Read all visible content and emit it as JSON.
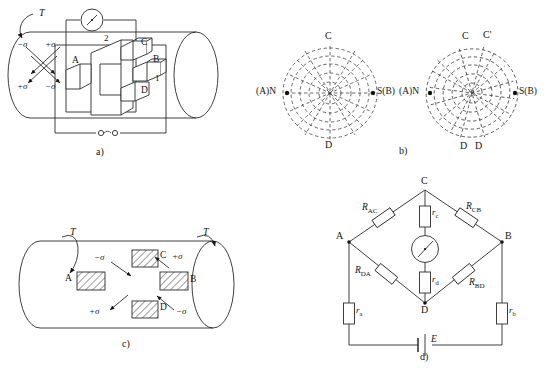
{
  "figure": {
    "panels": [
      {
        "id": "a",
        "caption": "a)"
      },
      {
        "id": "b",
        "caption": "b)"
      },
      {
        "id": "c",
        "caption": "c)"
      },
      {
        "id": "d",
        "caption": "d)"
      }
    ]
  },
  "panel_a": {
    "caption": "a)",
    "torque_label": "T",
    "stress": {
      "top_left": "−σ",
      "top_right": "+σ",
      "bottom_left": "+σ",
      "bottom_right": "−σ"
    },
    "core_labels": {
      "A": "A",
      "B": "B",
      "C": "C",
      "D": "D"
    },
    "winding_labels": {
      "secondary": "2",
      "primary": "1"
    },
    "meter_icon": "galvanometer-icon",
    "terminal_icon": "terminal-pair-icon"
  },
  "panel_b": {
    "caption": "b)",
    "left_diagram": {
      "name": "symmetric-flux-pattern",
      "top": "C",
      "bottom": "D",
      "left": "(A)N",
      "right": "S(B)",
      "left_pole_dot": "•",
      "right_pole_dot": "•"
    },
    "right_diagram": {
      "name": "skewed-flux-pattern",
      "top": "C",
      "top_prime": "C'",
      "bottom_left": "D",
      "bottom_right": "D",
      "left": "(A)N",
      "right": "S(B)",
      "left_pole_dot": "•",
      "right_pole_dot": "•"
    }
  },
  "panel_c": {
    "caption": "c)",
    "torque_left": "T",
    "torque_right": "T",
    "pads": [
      {
        "id": "A",
        "label": "A"
      },
      {
        "id": "C",
        "label": "C"
      },
      {
        "id": "B",
        "label": "B"
      },
      {
        "id": "D",
        "label": "D"
      }
    ],
    "stress": {
      "top_left": "−σ",
      "top_right": "+σ",
      "bottom_left": "+σ",
      "bottom_right": "−σ"
    }
  },
  "panel_d": {
    "caption": "d)",
    "nodes": {
      "top": "C",
      "left": "A",
      "right": "B",
      "bottom": "D"
    },
    "bridge_resistors": [
      {
        "name": "R_AC",
        "label_main": "R",
        "label_sub": "AC"
      },
      {
        "name": "R_CB",
        "label_main": "R",
        "label_sub": "CB"
      },
      {
        "name": "R_DA",
        "label_main": "R",
        "label_sub": "DA"
      },
      {
        "name": "R_BD",
        "label_main": "R",
        "label_sub": "BD"
      }
    ],
    "series_resistors": [
      {
        "name": "r_c",
        "label_main": "r",
        "label_sub": "c"
      },
      {
        "name": "r_d",
        "label_main": "r",
        "label_sub": "d"
      },
      {
        "name": "r_a",
        "label_main": "r",
        "label_sub": "a"
      },
      {
        "name": "r_b",
        "label_main": "r",
        "label_sub": "b"
      }
    ],
    "meter_icon": "galvanometer-icon",
    "source": {
      "label": "E",
      "icon": "battery-icon"
    }
  },
  "colors": {
    "ink": "#141414",
    "line": "#2a2a2a",
    "background": "#ffffff",
    "hatch": "#4a4a4a"
  }
}
